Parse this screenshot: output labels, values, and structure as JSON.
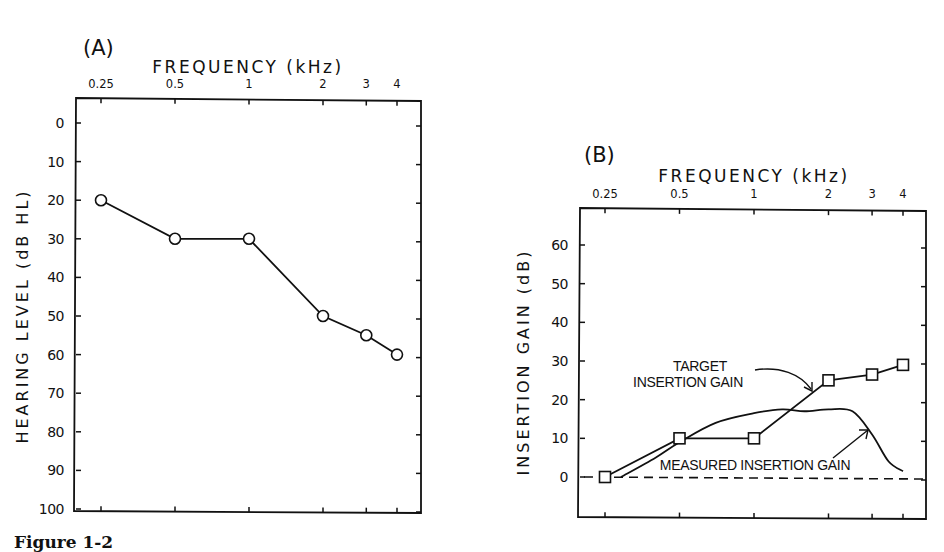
{
  "caption": "Figure 1-2",
  "chart_data": [
    {
      "type": "line",
      "panel_label": "(A)",
      "title": "FREQUENCY (kHz)",
      "xlabel": "FREQUENCY (kHz)",
      "ylabel": "HEARING LEVEL (dB HL)",
      "x_scale": "log",
      "x_ticks": [
        "0.25",
        "0.5",
        "1",
        "2",
        "3",
        "4"
      ],
      "x_tick_values": [
        0.25,
        0.5,
        1,
        2,
        3,
        4
      ],
      "y_ticks": [
        0,
        10,
        20,
        30,
        40,
        50,
        60,
        70,
        80,
        90,
        100
      ],
      "ylim": [
        0,
        100
      ],
      "y_inverted": true,
      "grid": false,
      "series": [
        {
          "name": "Hearing threshold",
          "marker": "circle-open",
          "x": [
            0.25,
            0.5,
            1,
            2,
            3,
            4
          ],
          "values": [
            20,
            30,
            30,
            50,
            55,
            60
          ]
        }
      ]
    },
    {
      "type": "line",
      "panel_label": "(B)",
      "title": "FREQUENCY (kHz)",
      "xlabel": "FREQUENCY (kHz)",
      "ylabel": "INSERTION GAIN (dB)",
      "x_scale": "log",
      "x_ticks": [
        "0.25",
        "0.5",
        "1",
        "2",
        "3",
        "4"
      ],
      "x_tick_values": [
        0.25,
        0.5,
        1,
        2,
        3,
        4
      ],
      "y_ticks": [
        0,
        10,
        20,
        30,
        40,
        50,
        60
      ],
      "ylim": [
        -10,
        70
      ],
      "grid": false,
      "reference_line": {
        "y": 0,
        "style": "dashed"
      },
      "series": [
        {
          "name": "TARGET INSERTION GAIN",
          "marker": "square-open",
          "x": [
            0.25,
            0.5,
            1,
            2,
            3,
            4
          ],
          "values": [
            0,
            10,
            10,
            25,
            26.5,
            29
          ]
        },
        {
          "name": "MEASURED INSERTION GAIN",
          "marker": "none",
          "smooth": true,
          "x": [
            0.29,
            0.4,
            0.5,
            0.7,
            1.0,
            1.3,
            1.6,
            2.0,
            2.5,
            3.0,
            3.5,
            4.0
          ],
          "values": [
            0,
            5,
            9,
            14,
            16.5,
            17.5,
            17,
            17.5,
            17,
            11,
            4,
            1.5
          ]
        }
      ],
      "annotations": [
        {
          "text": [
            "TARGET",
            "INSERTION GAIN"
          ],
          "points_to": "TARGET INSERTION GAIN"
        },
        {
          "text": [
            "MEASURED INSERTION GAIN"
          ],
          "points_to": "MEASURED INSERTION GAIN"
        }
      ]
    }
  ],
  "colors": {
    "ink": "#111111",
    "background": "#ffffff"
  }
}
